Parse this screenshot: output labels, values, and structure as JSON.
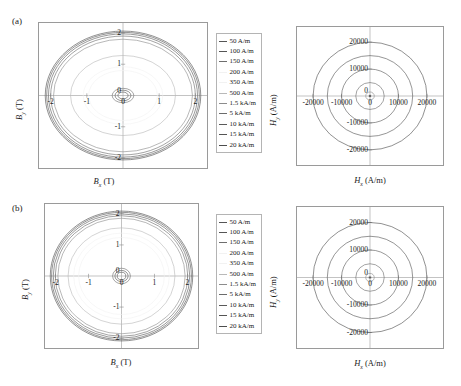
{
  "figure": {
    "panels": [
      {
        "tag": "(a)",
        "left": {
          "xlabel_name": "B",
          "xlabel_sub": "x",
          "xlabel_unit": " (T)",
          "ylabel_name": "B",
          "ylabel_sub": "y",
          "ylabel_unit": " (T)",
          "xticks": [
            "-2",
            "-1",
            "0",
            "1",
            "2"
          ],
          "yticks": [
            "-2",
            "-1",
            "0",
            "1",
            "2"
          ]
        },
        "right": {
          "xlabel_name": "H",
          "xlabel_sub": "x",
          "xlabel_unit": " (A/m)",
          "ylabel_name": "H",
          "ylabel_sub": "y",
          "ylabel_unit": " (A/m)",
          "xticks": [
            "-20,000",
            "-10,000",
            "0",
            "10,000",
            "20,000"
          ],
          "yticks": [
            "-20,000",
            "-10,000",
            "0",
            "10,000",
            "20,000"
          ]
        }
      },
      {
        "tag": "(b)",
        "left": {
          "xlabel_name": "B",
          "xlabel_sub": "x",
          "xlabel_unit": " (T)",
          "ylabel_name": "B",
          "ylabel_sub": "y",
          "ylabel_unit": " (T)",
          "xticks": [
            "-2",
            "-1",
            "0",
            "1",
            "2"
          ],
          "yticks": [
            "-2",
            "-1",
            "0",
            "1",
            "2"
          ]
        },
        "right": {
          "xlabel_name": "H",
          "xlabel_sub": "x",
          "xlabel_unit": " (A/m)",
          "ylabel_name": "H",
          "ylabel_sub": "y",
          "ylabel_unit": " (A/m)",
          "xticks": [
            "-20,000",
            "-10,000",
            "0",
            "10,000",
            "20,000"
          ],
          "yticks": [
            "-20,000",
            "-10,000",
            "0",
            "10,000",
            "20,000"
          ]
        }
      }
    ],
    "legend": {
      "entries": [
        {
          "label": "50 A/m",
          "color": "#555555"
        },
        {
          "label": "100 A/m",
          "color": "#555555"
        },
        {
          "label": "150 A/m",
          "color": "#6e6e6e"
        },
        {
          "label": "200 A/m",
          "color": "#f2f2f2"
        },
        {
          "label": "350 A/m",
          "color": "#f2f2f2"
        },
        {
          "label": "500 A/m",
          "color": "#b9b9b9"
        },
        {
          "label": "1.5 kA/m",
          "color": "#8c8c8c"
        },
        {
          "label": "5 kA/m",
          "color": "#6b6b6b"
        },
        {
          "label": "10 kA/m",
          "color": "#5a5a5a"
        },
        {
          "label": "15 kA/m",
          "color": "#545454"
        },
        {
          "label": "20 kA/m",
          "color": "#4d4d4d"
        }
      ]
    }
  },
  "chart_data": [
    {
      "type": "line",
      "panel": "a-left",
      "title": "",
      "xlabel": "Bx (T)",
      "ylabel": "By (T)",
      "xlim": [
        -2.35,
        2.35
      ],
      "ylim": [
        -2.35,
        2.35
      ],
      "xticks": [
        -2,
        -1,
        0,
        1,
        2
      ],
      "yticks": [
        -2,
        -1,
        0,
        1,
        2
      ],
      "grid": false,
      "description": "Nested elliptical B-field loci, anisotropic (wider in x than y)",
      "series": [
        {
          "name": "50 A/m",
          "rx": 0.14,
          "ry": 0.11
        },
        {
          "name": "100 A/m",
          "rx": 0.22,
          "ry": 0.17
        },
        {
          "name": "150 A/m",
          "rx": 0.3,
          "ry": 0.23
        },
        {
          "name": "200 A/m",
          "rx": 0.95,
          "ry": 0.8
        },
        {
          "name": "350 A/m",
          "rx": 1.1,
          "ry": 0.92
        },
        {
          "name": "500 A/m",
          "rx": 1.45,
          "ry": 1.28
        },
        {
          "name": "1.5 kA/m",
          "rx": 1.92,
          "ry": 1.8
        },
        {
          "name": "5 kA/m",
          "rx": 2.0,
          "ry": 1.9
        },
        {
          "name": "10 kA/m",
          "rx": 2.06,
          "ry": 1.97
        },
        {
          "name": "15 kA/m",
          "rx": 2.11,
          "ry": 2.02
        },
        {
          "name": "20 kA/m",
          "rx": 2.15,
          "ry": 2.06
        }
      ]
    },
    {
      "type": "line",
      "panel": "a-right",
      "title": "",
      "xlabel": "Hx (A/m)",
      "ylabel": "Hy (A/m)",
      "xlim": [
        -26000,
        26000
      ],
      "ylim": [
        -26000,
        26000
      ],
      "xticks": [
        -20000,
        -10000,
        0,
        10000,
        20000
      ],
      "yticks": [
        -20000,
        -10000,
        0,
        10000,
        20000
      ],
      "grid": false,
      "description": "Concentric circular H-field loci at each drive amplitude",
      "series": [
        {
          "name": "50 A/m",
          "r": 50
        },
        {
          "name": "100 A/m",
          "r": 100
        },
        {
          "name": "150 A/m",
          "r": 150
        },
        {
          "name": "200 A/m",
          "r": 200
        },
        {
          "name": "350 A/m",
          "r": 350
        },
        {
          "name": "500 A/m",
          "r": 500
        },
        {
          "name": "1.5 kA/m",
          "r": 1500
        },
        {
          "name": "5 kA/m",
          "r": 5000
        },
        {
          "name": "10 kA/m",
          "r": 10000
        },
        {
          "name": "15 kA/m",
          "r": 15000
        },
        {
          "name": "20 kA/m",
          "r": 20000
        }
      ]
    },
    {
      "type": "line",
      "panel": "b-left",
      "title": "",
      "xlabel": "Bx (T)",
      "ylabel": "By (T)",
      "xlim": [
        -2.35,
        2.35
      ],
      "ylim": [
        -2.35,
        2.35
      ],
      "xticks": [
        -2,
        -1,
        0,
        1,
        2
      ],
      "yticks": [
        -2,
        -1,
        0,
        1,
        2
      ],
      "grid": false,
      "description": "Nested near-circular B-field loci, more isotropic than panel (a)",
      "series": [
        {
          "name": "50 A/m",
          "rx": 0.13,
          "ry": 0.12
        },
        {
          "name": "100 A/m",
          "rx": 0.2,
          "ry": 0.18
        },
        {
          "name": "150 A/m",
          "rx": 0.27,
          "ry": 0.25
        },
        {
          "name": "200 A/m",
          "rx": 1.3,
          "ry": 1.24
        },
        {
          "name": "350 A/m",
          "rx": 1.45,
          "ry": 1.38
        },
        {
          "name": "500 A/m",
          "rx": 1.62,
          "ry": 1.55
        },
        {
          "name": "1.5 kA/m",
          "rx": 1.93,
          "ry": 1.86
        },
        {
          "name": "5 kA/m",
          "rx": 2.01,
          "ry": 1.94
        },
        {
          "name": "10 kA/m",
          "rx": 2.07,
          "ry": 2.0
        },
        {
          "name": "15 kA/m",
          "rx": 2.12,
          "ry": 2.05
        },
        {
          "name": "20 kA/m",
          "rx": 2.16,
          "ry": 2.09
        }
      ]
    },
    {
      "type": "line",
      "panel": "b-right",
      "title": "",
      "xlabel": "Hx (A/m)",
      "ylabel": "Hy (A/m)",
      "xlim": [
        -26000,
        26000
      ],
      "ylim": [
        -26000,
        26000
      ],
      "xticks": [
        -20000,
        -10000,
        0,
        10000,
        20000
      ],
      "yticks": [
        -20000,
        -10000,
        0,
        10000,
        20000
      ],
      "grid": false,
      "description": "Concentric circular H-field loci at each drive amplitude",
      "series": [
        {
          "name": "50 A/m",
          "r": 50
        },
        {
          "name": "100 A/m",
          "r": 100
        },
        {
          "name": "150 A/m",
          "r": 150
        },
        {
          "name": "200 A/m",
          "r": 200
        },
        {
          "name": "350 A/m",
          "r": 350
        },
        {
          "name": "500 A/m",
          "r": 500
        },
        {
          "name": "1.5 kA/m",
          "r": 1500
        },
        {
          "name": "5 kA/m",
          "r": 5000
        },
        {
          "name": "10 kA/m",
          "r": 10000
        },
        {
          "name": "15 kA/m",
          "r": 15000
        },
        {
          "name": "20 kA/m",
          "r": 20000
        }
      ]
    }
  ]
}
